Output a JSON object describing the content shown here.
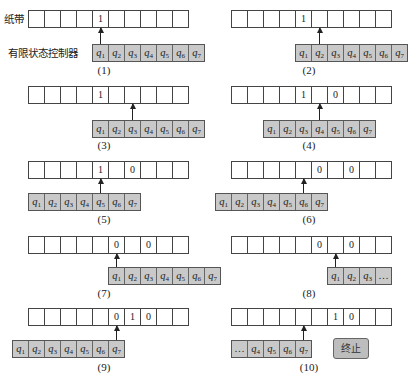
{
  "labels": {
    "tape": "纸带",
    "controller": "有限状态控制器",
    "stop": "终止"
  },
  "colors": {
    "controller_fill": "#c9c9c9",
    "tape_fill": "#ffffff",
    "line": "#444444"
  },
  "panels": [
    {
      "caption": "(1)",
      "tape": [
        "",
        "",
        "",
        "",
        "1",
        "",
        "",
        "",
        "",
        ""
      ],
      "head_index": 4,
      "controller": [
        "q1",
        "q2",
        "q3",
        "q4",
        "q5",
        "q6",
        "q7"
      ],
      "active_state": "q1"
    },
    {
      "caption": "(2)",
      "tape": [
        "",
        "",
        "",
        "",
        "1",
        "",
        "",
        "",
        "",
        ""
      ],
      "head_index": 5,
      "controller": [
        "q1",
        "q2",
        "q3",
        "q4",
        "q5",
        "q6",
        "q7"
      ],
      "active_state": "q2"
    },
    {
      "caption": "(3)",
      "tape": [
        "",
        "",
        "",
        "",
        "1",
        "",
        "",
        "",
        "",
        ""
      ],
      "head_index": 6,
      "controller": [
        "q1",
        "q2",
        "q3",
        "q4",
        "q5",
        "q6",
        "q7"
      ],
      "active_state": "q3"
    },
    {
      "caption": "(4)",
      "tape": [
        "",
        "",
        "",
        "",
        "1",
        "",
        "0",
        "",
        "",
        ""
      ],
      "head_index": 5,
      "controller": [
        "q1",
        "q2",
        "q3",
        "q4",
        "q5",
        "q6",
        "q7"
      ],
      "active_state": "q4"
    },
    {
      "caption": "(5)",
      "tape": [
        "",
        "",
        "",
        "",
        "1",
        "",
        "0",
        "",
        "",
        ""
      ],
      "head_index": 4,
      "controller": [
        "q1",
        "q2",
        "q3",
        "q4",
        "q5",
        "q6",
        "q7"
      ],
      "active_state": "q5"
    },
    {
      "caption": "(6)",
      "tape": [
        "",
        "",
        "",
        "",
        "",
        "0",
        "",
        "0",
        "",
        ""
      ],
      "head_index": 4,
      "controller": [
        "q1",
        "q2",
        "q3",
        "q4",
        "q5",
        "q6",
        "q7"
      ],
      "active_state": "q6"
    },
    {
      "caption": "(7)",
      "tape": [
        "",
        "",
        "",
        "",
        "",
        "0",
        "",
        "0",
        "",
        ""
      ],
      "head_index": 5,
      "controller": [
        "q1",
        "q2",
        "q3",
        "q4",
        "q5",
        "q6",
        "q7"
      ],
      "active_state": "q1"
    },
    {
      "caption": "(8)",
      "tape": [
        "",
        "",
        "",
        "",
        "",
        "0",
        "",
        "0",
        "",
        ""
      ],
      "head_index": 6,
      "controller": [
        "q1",
        "q2",
        "q3",
        "…"
      ],
      "active_state": "q1"
    },
    {
      "caption": "(9)",
      "tape": [
        "",
        "",
        "",
        "",
        "",
        "0",
        "1",
        "0",
        "",
        ""
      ],
      "head_index": 5,
      "controller": [
        "q1",
        "q2",
        "q3",
        "q4",
        "q5",
        "q6",
        "q7"
      ],
      "active_state": "q7"
    },
    {
      "caption": "(10)",
      "tape": [
        "",
        "",
        "",
        "",
        "",
        "",
        "1",
        "0",
        "",
        ""
      ],
      "head_index": 4,
      "controller": [
        "…",
        "q4",
        "q5",
        "q6",
        "q7"
      ],
      "active_state": "q7",
      "status": "终止"
    }
  ]
}
